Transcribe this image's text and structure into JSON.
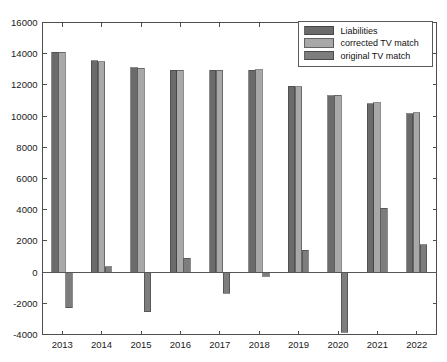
{
  "chart_data": {
    "type": "bar",
    "title": "",
    "xlabel": "",
    "ylabel": "",
    "categories": [
      "2013",
      "2014",
      "2015",
      "2016",
      "2017",
      "2018",
      "2019",
      "2020",
      "2021",
      "2022"
    ],
    "series": [
      {
        "name": "Liabilities",
        "color": "#6b6b6b",
        "values": [
          14100,
          13550,
          13100,
          12950,
          12950,
          12950,
          11900,
          11300,
          10800,
          10150
        ]
      },
      {
        "name": "corrected TV match",
        "color": "#a8a8a8",
        "values": [
          14080,
          13500,
          13080,
          12930,
          12930,
          12960,
          11880,
          11350,
          10850,
          10200
        ]
      },
      {
        "name": "original TV match",
        "color": "#7d7d7d",
        "values": [
          -2300,
          350,
          -2550,
          900,
          -1350,
          -250,
          1400,
          -3850,
          4100,
          1750
        ]
      }
    ],
    "ylim": [
      -4000,
      16000
    ],
    "yticks": [
      -4000,
      -2000,
      0,
      2000,
      4000,
      6000,
      8000,
      10000,
      12000,
      14000,
      16000
    ],
    "ytick_labels": [
      "-4000",
      "-2000",
      "0",
      "2000",
      "4000",
      "6000",
      "8000",
      "10000",
      "12000",
      "14000",
      "16000"
    ],
    "grid": false,
    "legend_position": "top-right",
    "legend_entries": [
      {
        "label": "Liabilities",
        "color": "#6b6b6b"
      },
      {
        "label": "corrected TV match",
        "color": "#a8a8a8"
      },
      {
        "label": "original TV match",
        "color": "#7d7d7d"
      }
    ]
  },
  "colors": {
    "axis": "#4d4d4d",
    "background": "#ffffff",
    "text": "#1a1a1a"
  }
}
